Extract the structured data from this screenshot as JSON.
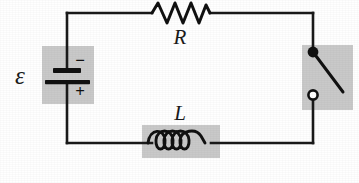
{
  "figure": {
    "kind": "electrical-circuit-schematic",
    "width": 359,
    "height": 183,
    "background_color": "#ffffff",
    "wire_color": "#1a1a1a",
    "shade_color": "#c9c9c9"
  },
  "labels": {
    "emf": "ε",
    "resistor": "R",
    "inductor": "L",
    "battery_negative": "−",
    "battery_positive": "+"
  },
  "components": {
    "battery": {
      "name": "battery",
      "symbol_label": "ε",
      "position": "left-side",
      "negative_terminal": "top",
      "positive_terminal": "bottom",
      "shaded": true
    },
    "resistor": {
      "name": "resistor",
      "symbol_label": "R",
      "position": "top-side",
      "zigzag_peaks": 4,
      "shaded": false
    },
    "inductor": {
      "name": "inductor",
      "symbol_label": "L",
      "position": "bottom-side",
      "coil_loops": 4,
      "shaded": true
    },
    "switch": {
      "name": "switch",
      "position": "right-side",
      "state": "open",
      "pivot_terminal": "top-filled",
      "contact_terminal": "bottom-hollow",
      "shaded": true
    }
  },
  "geometry": {
    "loop": {
      "left_x": 67,
      "right_x": 313,
      "top_y": 13,
      "bottom_y": 143
    },
    "battery_box": {
      "x": 42,
      "y": 46,
      "w": 52,
      "h": 58
    },
    "inductor_box": {
      "x": 142,
      "y": 125,
      "w": 78,
      "h": 33
    },
    "switch_box": {
      "x": 302,
      "y": 45,
      "w": 51,
      "h": 65
    },
    "resistor_span": {
      "x1": 152,
      "x2": 210,
      "y": 13
    },
    "switch_pivot": {
      "cx": 313,
      "cy": 52,
      "r": 5.2
    },
    "switch_contact": {
      "cx": 313,
      "cy": 95,
      "r": 5.2
    },
    "switch_blade_end": {
      "x": 343,
      "y": 92
    },
    "label_positions": {
      "emf": {
        "x": 20,
        "y": 84
      },
      "resistor": {
        "x": 180,
        "y": 44
      },
      "inductor": {
        "x": 180,
        "y": 120
      },
      "minus": {
        "x": 80,
        "y": 66
      },
      "plus": {
        "x": 80,
        "y": 97
      }
    }
  }
}
